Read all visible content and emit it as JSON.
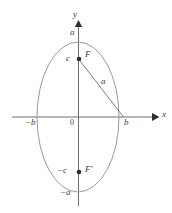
{
  "figure": {
    "kind": "ellipse-foci-diagram",
    "width": 172,
    "height": 213,
    "background": "#ffffff",
    "colors": {
      "ellipse_stroke": "#9b9b9b",
      "axis_stroke": "#6e6e6e",
      "chord_stroke": "#6e6e6e",
      "point_fill": "#2e2e2e",
      "label_text": "#3c3c3c"
    },
    "geometry": {
      "origin": {
        "x": 78,
        "y": 117
      },
      "semi_axis_x": 41,
      "semi_axis_y": 75,
      "focus_upper": {
        "x": 79,
        "y": 59
      },
      "focus_lower": {
        "x": 79,
        "y": 172
      },
      "vertex_right": {
        "x": 124,
        "y": 117
      },
      "vertex_left": {
        "x": 37,
        "y": 117
      }
    },
    "axes": {
      "x_axis_label": "x",
      "y_axis_label": "y",
      "origin_label": "0"
    },
    "labels": {
      "top_vertex": "a",
      "bottom_vertex": "−a",
      "right_vertex": "b",
      "left_vertex": "−b",
      "focus_upper_coord": "c",
      "focus_lower_coord": "−c",
      "focus_upper_name": "F",
      "focus_lower_name": "F′",
      "chord_length": "a"
    }
  }
}
